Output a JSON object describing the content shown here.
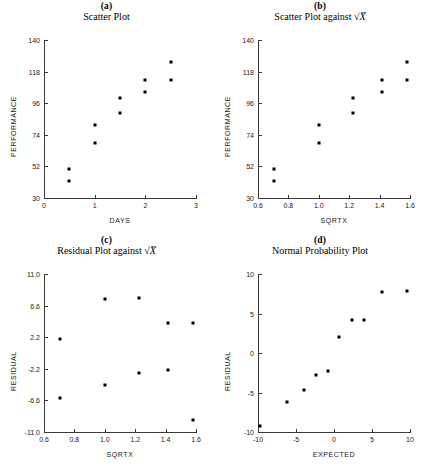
{
  "figure": {
    "width": 427,
    "height": 468,
    "background": "#ffffff",
    "marker_color": "#000000",
    "axis_color": "#3a3a3a"
  },
  "panels": [
    {
      "letter": "(a)",
      "title": "Scatter Plot",
      "title_has_sqrt": false,
      "xlabel": "DAYS",
      "ylabel": "PERFORMANCE",
      "xticks": [
        "0",
        "1",
        "2",
        "3"
      ],
      "xtick_values": [
        0,
        1,
        2,
        3
      ],
      "yticks": [
        "30",
        "52",
        "74",
        "96",
        "118",
        "140"
      ],
      "ytick_values": [
        30,
        52,
        74,
        96,
        118,
        140
      ],
      "xlim": [
        0,
        3
      ],
      "ylim": [
        30,
        140
      ]
    },
    {
      "letter": "(b)",
      "title": "Scatter Plot against",
      "title_has_sqrt": true,
      "xlabel": "SQRTX",
      "ylabel": "PERFORMANCE",
      "xticks": [
        "0.6",
        "0.8",
        "1.0",
        "1.2",
        "1.4",
        "1.6"
      ],
      "xtick_values": [
        0.6,
        0.8,
        1.0,
        1.2,
        1.4,
        1.6
      ],
      "yticks": [
        "30",
        "52",
        "74",
        "96",
        "118",
        "140"
      ],
      "ytick_values": [
        30,
        52,
        74,
        96,
        118,
        140
      ],
      "xlim": [
        0.6,
        1.6
      ],
      "ylim": [
        30,
        140
      ]
    },
    {
      "letter": "(c)",
      "title": "Residual Plot against",
      "title_has_sqrt": true,
      "xlabel": "SQRTX",
      "ylabel": "RESIDUAL",
      "xticks": [
        "0.6",
        "0.8",
        "1.0",
        "1.2",
        "1.4",
        "1.6"
      ],
      "xtick_values": [
        0.6,
        0.8,
        1.0,
        1.2,
        1.4,
        1.6
      ],
      "yticks": [
        "-11.0",
        "-6.6",
        "-2.2",
        "2.2",
        "6.6",
        "11.0"
      ],
      "ytick_values": [
        -11.0,
        -6.6,
        -2.2,
        2.2,
        6.6,
        11.0
      ],
      "xlim": [
        0.6,
        1.6
      ],
      "ylim": [
        -11.0,
        11.0
      ]
    },
    {
      "letter": "(d)",
      "title": "Normal Probability Plot",
      "title_has_sqrt": false,
      "xlabel": "EXPECTED",
      "ylabel": "RESIDUAL",
      "xticks": [
        "-10",
        "-5",
        "0",
        "5",
        "10"
      ],
      "xtick_values": [
        -10,
        -5,
        0,
        5,
        10
      ],
      "yticks": [
        "-10",
        "-5",
        "0",
        "5",
        "10"
      ],
      "ytick_values": [
        -10,
        -5,
        0,
        5,
        10
      ],
      "xlim": [
        -10,
        10
      ],
      "ylim": [
        -10,
        10
      ]
    }
  ],
  "chart_data": [
    {
      "type": "scatter",
      "panel": "(a)",
      "title": "Scatter Plot",
      "xlabel": "DAYS",
      "ylabel": "PERFORMANCE",
      "xlim": [
        0,
        3
      ],
      "ylim": [
        30,
        140
      ],
      "grid": false,
      "legend": false,
      "x": [
        0.5,
        0.5,
        1.0,
        1.0,
        1.5,
        1.5,
        2.0,
        2.0,
        2.5,
        2.5
      ],
      "y": [
        50.5,
        42.0,
        80.5,
        68.0,
        99.5,
        89.0,
        112.0,
        104.0,
        125.0,
        112.0
      ]
    },
    {
      "type": "scatter",
      "panel": "(b)",
      "title": "Scatter Plot against √X",
      "xlabel": "SQRTX",
      "ylabel": "PERFORMANCE",
      "xlim": [
        0.6,
        1.6
      ],
      "ylim": [
        30,
        140
      ],
      "grid": false,
      "legend": false,
      "x": [
        0.707,
        0.707,
        1.0,
        1.0,
        1.225,
        1.225,
        1.414,
        1.414,
        1.581,
        1.581
      ],
      "y": [
        50.5,
        42.0,
        80.5,
        68.0,
        99.5,
        89.0,
        112.0,
        104.0,
        125.0,
        112.0
      ]
    },
    {
      "type": "scatter",
      "panel": "(c)",
      "title": "Residual Plot against √X",
      "xlabel": "SQRTX",
      "ylabel": "RESIDUAL",
      "xlim": [
        0.6,
        1.6
      ],
      "ylim": [
        -11.0,
        11.0
      ],
      "grid": false,
      "legend": false,
      "x": [
        0.707,
        0.707,
        1.0,
        1.0,
        1.225,
        1.225,
        1.414,
        1.414,
        1.581,
        1.581
      ],
      "y": [
        2.0,
        -6.2,
        7.5,
        -4.4,
        7.7,
        -2.8,
        4.2,
        -2.3,
        4.2,
        -9.3
      ]
    },
    {
      "type": "scatter",
      "panel": "(d)",
      "title": "Normal Probability Plot",
      "xlabel": "EXPECTED",
      "ylabel": "RESIDUAL",
      "xlim": [
        -10,
        10
      ],
      "ylim": [
        -10,
        10
      ],
      "grid": false,
      "legend": false,
      "x": [
        -9.8,
        -6.2,
        -4.0,
        -2.4,
        -0.8,
        0.7,
        2.4,
        4.0,
        6.3,
        9.6
      ],
      "y": [
        -9.3,
        -6.2,
        -4.7,
        -2.8,
        -2.3,
        2.0,
        4.2,
        4.2,
        7.7,
        7.8
      ]
    }
  ]
}
